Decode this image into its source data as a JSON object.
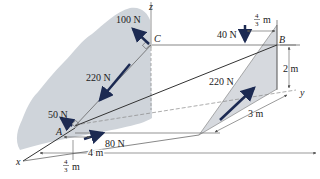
{
  "figure": {
    "type": "statics-3d-force-diagram",
    "colors": {
      "wall": "#cfd4da",
      "plate": "#d6d9de",
      "force_arrow": "#1c2a52",
      "line": "#333333",
      "dim_line": "#555555"
    },
    "axes": {
      "x": "x",
      "y": "y",
      "z": "z"
    },
    "points": {
      "A": "A",
      "B": "B",
      "C": "C"
    },
    "forces": [
      {
        "id": "f100",
        "label": "100 N",
        "at": "C"
      },
      {
        "id": "f220_wall",
        "label": "220 N",
        "along": "BA"
      },
      {
        "id": "f220_plate",
        "label": "220 N",
        "along": "B"
      },
      {
        "id": "f40",
        "label": "40 N",
        "direction": "down"
      },
      {
        "id": "f50",
        "label": "50 N",
        "at": "A"
      },
      {
        "id": "f80",
        "label": "80 N",
        "at": "A"
      }
    ],
    "dimensions": {
      "top_offset": {
        "num": "4",
        "den": "3",
        "unit": "m"
      },
      "height": "2 m",
      "depth": "3 m",
      "length": "4 m",
      "bottom_offset": {
        "num": "4",
        "den": "3",
        "unit": "m"
      }
    }
  }
}
